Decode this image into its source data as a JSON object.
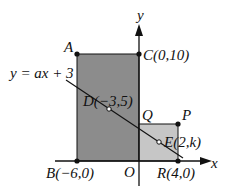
{
  "diagram": {
    "axes": {
      "x_label": "x",
      "y_label": "y",
      "origin_label": "O"
    },
    "line_equation": "y = ax + 3",
    "points": {
      "A": {
        "label": "A"
      },
      "B": {
        "label": "B(−6,0)"
      },
      "C": {
        "label": "C(0,10)"
      },
      "D": {
        "label": "D(−3,5)"
      },
      "E": {
        "label": "E(2,k)"
      },
      "P": {
        "label": "P"
      },
      "Q": {
        "label": "Q"
      },
      "R": {
        "label": "R(4,0)"
      }
    },
    "colors": {
      "large_rect_fill": "#8c8c8c",
      "small_rect_fill": "#c6c6c6",
      "stroke": "#111111"
    }
  }
}
